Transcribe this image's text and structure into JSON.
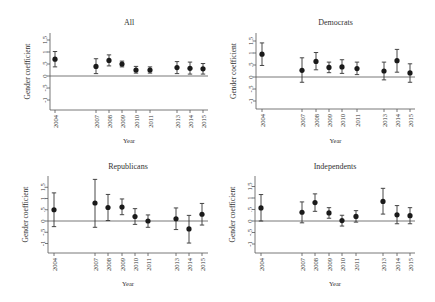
{
  "chart_data": [
    {
      "type": "scatter",
      "title": "All",
      "xlabel": "Year",
      "ylabel": "Gender coefficient",
      "ytick_labels": [
        "1.5",
        "1",
        ".5",
        "0",
        "-.5",
        "-1"
      ],
      "ylim": [
        -1.2,
        1.9
      ],
      "categories": [
        "2004",
        "2007",
        "2008",
        "2009",
        "2010",
        "2011",
        "2013",
        "2014",
        "2015"
      ],
      "values": [
        0.7,
        0.4,
        0.65,
        0.5,
        0.25,
        0.25,
        0.35,
        0.32,
        0.3
      ],
      "ci_low": [
        0.38,
        0.1,
        0.42,
        0.38,
        0.12,
        0.12,
        0.1,
        0.08,
        0.08
      ],
      "ci_high": [
        1.02,
        0.72,
        0.88,
        0.62,
        0.4,
        0.38,
        0.6,
        0.58,
        0.52
      ]
    },
    {
      "type": "scatter",
      "title": "Democrats",
      "xlabel": "Year",
      "ylabel": "Gender coefficient",
      "ytick_labels": [
        "1.5",
        "1",
        ".5",
        "0",
        "-.5",
        "-1"
      ],
      "ylim": [
        -1.2,
        1.9
      ],
      "categories": [
        "2004",
        "2007",
        "2008",
        "2009",
        "2010",
        "2011",
        "2013",
        "2014",
        "2015"
      ],
      "values": [
        0.95,
        0.28,
        0.65,
        0.4,
        0.42,
        0.35,
        0.25,
        0.68,
        0.17
      ],
      "ci_low": [
        0.48,
        -0.22,
        0.3,
        0.18,
        0.15,
        0.1,
        -0.12,
        0.2,
        -0.22
      ],
      "ci_high": [
        1.42,
        0.8,
        1.02,
        0.62,
        0.72,
        0.62,
        0.62,
        1.15,
        0.55
      ]
    },
    {
      "type": "scatter",
      "title": "Republicans",
      "xlabel": "Year",
      "ylabel": "Gender coefficient",
      "ytick_labels": [
        "1.5",
        "1",
        ".5",
        "0",
        "-.5",
        "-1"
      ],
      "ylim": [
        -1.2,
        1.9
      ],
      "categories": [
        "2004",
        "2007",
        "2008",
        "2009",
        "2010",
        "2011",
        "2013",
        "2014",
        "2015"
      ],
      "values": [
        0.5,
        0.8,
        0.6,
        0.62,
        0.2,
        0.0,
        0.1,
        -0.35,
        0.3
      ],
      "ci_low": [
        -0.25,
        -0.28,
        0.02,
        0.28,
        -0.15,
        -0.28,
        -0.38,
        -0.98,
        -0.18
      ],
      "ci_high": [
        1.25,
        1.85,
        1.18,
        0.98,
        0.55,
        0.27,
        0.58,
        0.25,
        0.78
      ]
    },
    {
      "type": "scatter",
      "title": "Independents",
      "xlabel": "Year",
      "ylabel": "Gender coefficient",
      "ytick_labels": [
        "1.5",
        "1",
        ".5",
        "0",
        "-.5",
        "-1"
      ],
      "ylim": [
        -1.2,
        1.9
      ],
      "categories": [
        "2004",
        "2007",
        "2008",
        "2009",
        "2010",
        "2011",
        "2013",
        "2014",
        "2015"
      ],
      "values": [
        0.57,
        0.38,
        0.8,
        0.35,
        0.02,
        0.2,
        0.85,
        0.27,
        0.23
      ],
      "ci_low": [
        0.0,
        -0.08,
        0.42,
        0.12,
        -0.22,
        -0.05,
        0.3,
        -0.12,
        -0.12
      ],
      "ci_high": [
        1.15,
        0.83,
        1.18,
        0.58,
        0.25,
        0.45,
        1.42,
        0.67,
        0.58
      ]
    }
  ],
  "layout": {
    "panels": [
      {
        "ax_left": 50,
        "ax_right": 208,
        "zero_y": 76,
        "unit_px": 24,
        "ax_top": 33,
        "ax_bottom": 110,
        "title_y": 25,
        "xlabel_y": 143,
        "x": [
          55,
          96,
          109,
          122,
          136,
          150,
          177,
          190,
          203
        ]
      },
      {
        "ax_left": 256,
        "ax_right": 415,
        "zero_y": 77,
        "unit_px": 24,
        "ax_top": 33,
        "ax_bottom": 109,
        "title_y": 25,
        "xlabel_y": 143,
        "x": [
          262,
          302,
          316,
          329,
          342,
          357,
          384,
          397,
          410
        ]
      },
      {
        "ax_left": 48,
        "ax_right": 208,
        "zero_y": 221,
        "unit_px": 22.5,
        "ax_top": 176,
        "ax_bottom": 253,
        "title_y": 169,
        "xlabel_y": 286,
        "x": [
          54,
          95,
          108,
          122,
          135,
          148,
          176,
          189,
          202
        ]
      },
      {
        "ax_left": 255,
        "ax_right": 415,
        "zero_y": 221,
        "unit_px": 23,
        "ax_top": 176,
        "ax_bottom": 253,
        "title_y": 169,
        "xlabel_y": 286,
        "x": [
          261,
          302,
          315,
          329,
          342,
          356,
          383,
          397,
          410
        ]
      }
    ]
  }
}
